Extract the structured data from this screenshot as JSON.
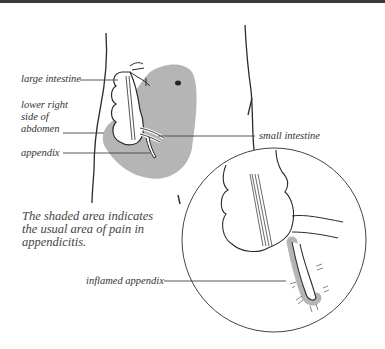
{
  "figure": {
    "labels": {
      "large_intestine": "large intestine",
      "lower_right_side": [
        "lower right",
        "side of",
        "abdomen"
      ],
      "appendix": "appendix",
      "small_intestine": "small intestine",
      "inflamed_appendix": "inflamed appendix"
    },
    "caption": [
      "The shaded area indicates",
      "the usual area of pain in",
      "appendicitis."
    ],
    "colors": {
      "shading": "#b5b5b5",
      "line": "#2a2a2a",
      "topbar": "#3a3a3a"
    }
  }
}
